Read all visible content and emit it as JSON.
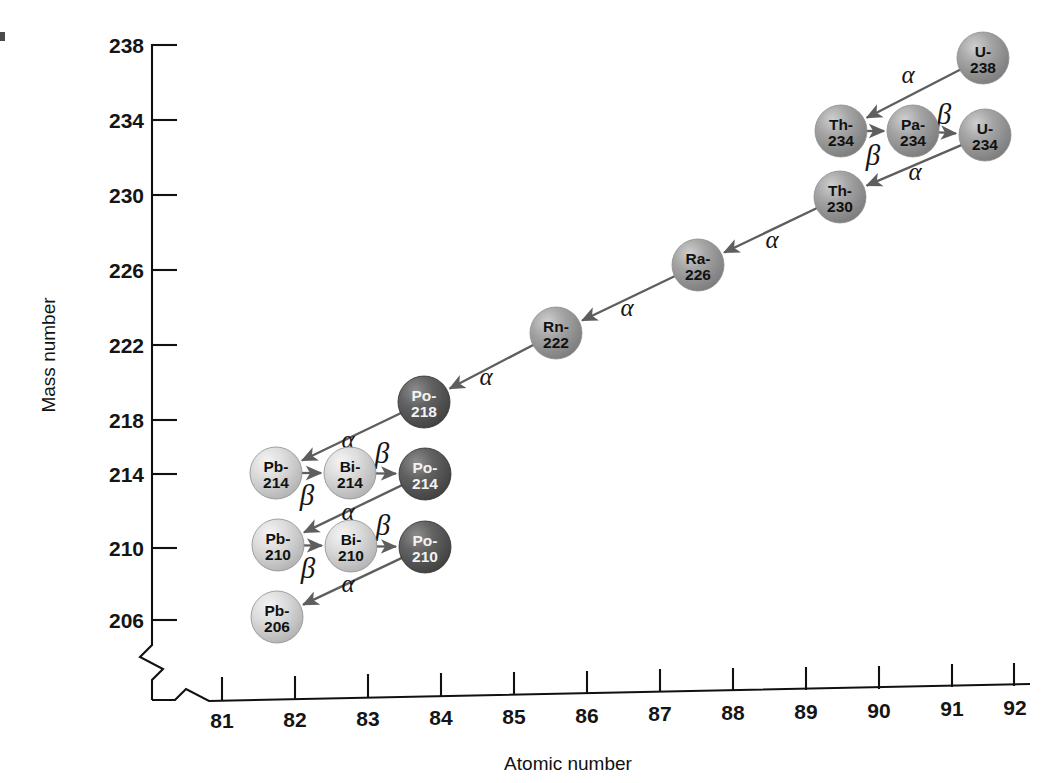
{
  "figure": {
    "type": "decay-chain-diagram",
    "background": "#ffffff"
  },
  "axes": {
    "x": {
      "label": "Atomic number",
      "ticks": [
        "81",
        "82",
        "83",
        "84",
        "85",
        "86",
        "87",
        "88",
        "89",
        "90",
        "91",
        "92"
      ],
      "tick_values": [
        81,
        82,
        83,
        84,
        85,
        86,
        87,
        88,
        89,
        90,
        91,
        92
      ],
      "range": [
        81,
        92
      ],
      "has_break": true
    },
    "y": {
      "label": "Mass number",
      "ticks": [
        "206",
        "210",
        "214",
        "218",
        "222",
        "226",
        "230",
        "234",
        "238"
      ],
      "tick_values": [
        206,
        210,
        214,
        218,
        222,
        226,
        230,
        234,
        238
      ],
      "range": [
        206,
        238
      ],
      "has_break": true
    }
  },
  "colors": {
    "sphere_light": "#cfcfcf",
    "sphere_light_hi": "#eeeeee",
    "sphere_mid": "#9a9a9a",
    "sphere_mid_hi": "#c9c9c9",
    "sphere_dark": "#555555",
    "sphere_dark_hi": "#8a8a8a",
    "arrow": "#5e5e5e",
    "axis": "#111111",
    "text": "#151515"
  },
  "chart_data": {
    "type": "scatter",
    "xlabel": "Atomic number",
    "ylabel": "Mass number",
    "xlim": [
      81,
      92
    ],
    "ylim": [
      206,
      238
    ],
    "grid": false,
    "legend": "none",
    "nodes": [
      {
        "id": "U-238",
        "element": "U-",
        "mass": "238",
        "z": 92,
        "a": 238,
        "shade": "mid",
        "cx": 983,
        "cy": 58
      },
      {
        "id": "Th-234",
        "element": "Th-",
        "mass": "234",
        "z": 90,
        "a": 234,
        "shade": "mid",
        "cx": 841,
        "cy": 131
      },
      {
        "id": "Pa-234",
        "element": "Pa-",
        "mass": "234",
        "z": 91,
        "a": 234,
        "shade": "mid",
        "cx": 913,
        "cy": 131
      },
      {
        "id": "U-234",
        "element": "U-",
        "mass": "234",
        "z": 92,
        "a": 234,
        "shade": "mid",
        "cx": 985,
        "cy": 135
      },
      {
        "id": "Th-230",
        "element": "Th-",
        "mass": "230",
        "z": 90,
        "a": 230,
        "shade": "mid",
        "cx": 840,
        "cy": 197
      },
      {
        "id": "Ra-226",
        "element": "Ra-",
        "mass": "226",
        "z": 88,
        "a": 226,
        "shade": "mid",
        "cx": 698,
        "cy": 265
      },
      {
        "id": "Rn-222",
        "element": "Rn-",
        "mass": "222",
        "z": 86,
        "a": 222,
        "shade": "mid",
        "cx": 556,
        "cy": 333
      },
      {
        "id": "Po-218",
        "element": "Po-",
        "mass": "218",
        "z": 84,
        "a": 218,
        "shade": "dark",
        "cx": 424,
        "cy": 402
      },
      {
        "id": "Pb-214",
        "element": "Pb-",
        "mass": "214",
        "z": 82,
        "a": 214,
        "shade": "light",
        "cx": 276,
        "cy": 473
      },
      {
        "id": "Bi-214",
        "element": "Bi-",
        "mass": "214",
        "z": 83,
        "a": 214,
        "shade": "light",
        "cx": 350,
        "cy": 473
      },
      {
        "id": "Po-214",
        "element": "Po-",
        "mass": "214",
        "z": 84,
        "a": 214,
        "shade": "dark",
        "cx": 425,
        "cy": 474
      },
      {
        "id": "Pb-210",
        "element": "Pb-",
        "mass": "210",
        "z": 82,
        "a": 210,
        "shade": "light",
        "cx": 278,
        "cy": 545
      },
      {
        "id": "Bi-210",
        "element": "Bi-",
        "mass": "210",
        "z": 83,
        "a": 210,
        "shade": "light",
        "cx": 351,
        "cy": 546
      },
      {
        "id": "Po-210",
        "element": "Po-",
        "mass": "210",
        "z": 84,
        "a": 210,
        "shade": "dark",
        "cx": 425,
        "cy": 547
      },
      {
        "id": "Pb-206",
        "element": "Pb-",
        "mass": "206",
        "z": 82,
        "a": 206,
        "shade": "light",
        "cx": 277,
        "cy": 617
      }
    ],
    "transitions": [
      {
        "from": "U-238",
        "to": "Th-234",
        "type": "alpha",
        "label": "α",
        "lx": 908,
        "ly": 83
      },
      {
        "from": "Th-234",
        "to": "Pa-234",
        "type": "beta",
        "label": "β",
        "lx": 873,
        "ly": 165
      },
      {
        "from": "Pa-234",
        "to": "U-234",
        "type": "beta",
        "label": "β",
        "lx": 944,
        "ly": 124
      },
      {
        "from": "U-234",
        "to": "Th-230",
        "type": "alpha",
        "label": "α",
        "lx": 915,
        "ly": 180
      },
      {
        "from": "Th-230",
        "to": "Ra-226",
        "type": "alpha",
        "label": "α",
        "lx": 772,
        "ly": 248
      },
      {
        "from": "Ra-226",
        "to": "Rn-222",
        "type": "alpha",
        "label": "α",
        "lx": 627,
        "ly": 316
      },
      {
        "from": "Rn-222",
        "to": "Po-218",
        "type": "alpha",
        "label": "α",
        "lx": 486,
        "ly": 385
      },
      {
        "from": "Po-218",
        "to": "Pb-214",
        "type": "alpha",
        "label": "α",
        "lx": 348,
        "ly": 448
      },
      {
        "from": "Pb-214",
        "to": "Bi-214",
        "type": "beta",
        "label": "β",
        "lx": 307,
        "ly": 505
      },
      {
        "from": "Bi-214",
        "to": "Po-214",
        "type": "beta",
        "label": "β",
        "lx": 382,
        "ly": 463
      },
      {
        "from": "Po-214",
        "to": "Pb-210",
        "type": "alpha",
        "label": "α",
        "lx": 348,
        "ly": 520
      },
      {
        "from": "Pb-210",
        "to": "Bi-210",
        "type": "beta",
        "label": "β",
        "lx": 308,
        "ly": 578
      },
      {
        "from": "Bi-210",
        "to": "Po-210",
        "type": "beta",
        "label": "β",
        "lx": 383,
        "ly": 535
      },
      {
        "from": "Po-210",
        "to": "Pb-206",
        "type": "alpha",
        "label": "α",
        "lx": 348,
        "ly": 592
      }
    ]
  }
}
